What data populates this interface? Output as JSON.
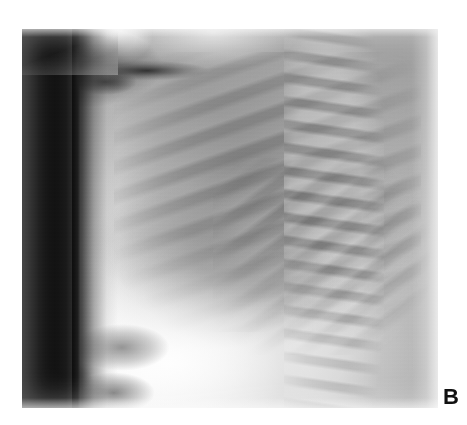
{
  "figure": {
    "panel_label": "B",
    "modality": "radiograph",
    "view": "lateral chest",
    "label_color": "#111111",
    "background_color": "#ffffff"
  },
  "image": {
    "alt": "Lateral chest radiograph showing the thorax in profile",
    "frame": {
      "left": 22,
      "top": 29,
      "width": 416,
      "height": 379
    },
    "regions": [
      {
        "name": "collimation-band",
        "description": "unexposed black vertical band along left edge",
        "tone": "#101010"
      },
      {
        "name": "anterior-chest-wall",
        "description": "bright soft-tissue band anteriorly",
        "tone": "#f2f2f2"
      },
      {
        "name": "lung-field",
        "description": "aerated retrosternal and mid lung, darker grey",
        "tone": "#6e6e6e"
      },
      {
        "name": "posterior-ribs",
        "description": "oblique alternating rib shadows across lung",
        "tone": "#8c8c8c"
      },
      {
        "name": "cardiac-shadow",
        "description": "mediastinal and cardiac density, mid-lower chest",
        "tone": "#8a8a8a"
      },
      {
        "name": "thoracic-spine",
        "description": "vertebral bodies stacked along posterior right",
        "tone": "#c8c8c8"
      },
      {
        "name": "diaphragm",
        "description": "bright diaphragmatic dome sweeping to lower left",
        "tone": "#f5f5f5"
      },
      {
        "name": "gastric-bowel-gas",
        "description": "rounded darker gas collections below diaphragm",
        "tone": "#707070"
      },
      {
        "name": "shoulder-apex",
        "description": "bright shoulder/mandible wedge at top of frame",
        "tone": "#fbfbfb"
      }
    ]
  }
}
